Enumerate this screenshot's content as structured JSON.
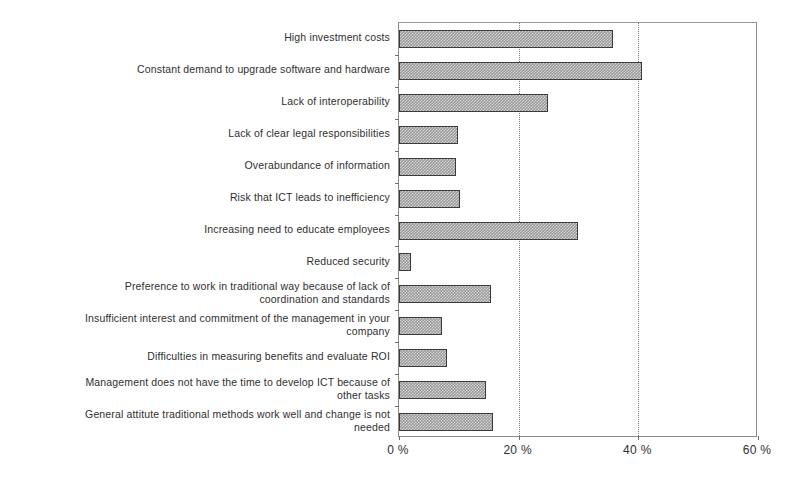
{
  "chart_data": {
    "type": "bar",
    "orientation": "horizontal",
    "title": "",
    "subtitle": "",
    "xlabel": "",
    "ylabel": "",
    "xlim": [
      0,
      60
    ],
    "xticks": [
      0,
      20,
      40,
      60
    ],
    "xticklabels": [
      "0 %",
      "20 %",
      "40 %",
      "60 %"
    ],
    "grid": "vertical-dotted-at-20-and-40",
    "legend": "none",
    "bar_color": "#9a9a9a",
    "bar_border_color": "#3b3b3b",
    "axis_color": "#8a8a8a",
    "categories": [
      "High investment costs",
      "Constant demand to upgrade software and hardware",
      "Lack of interoperability",
      "Lack of clear legal responsibilities",
      "Overabundance of information",
      "Risk that ICT leads to inefficiency",
      "Increasing need to educate employees",
      "Reduced security",
      "Preference to work in traditional way because of lack of\ncoordination and standards",
      "Insufficient interest and commitment of the management in your\ncompany",
      "Difficulties in measuring benefits and evaluate ROI",
      "Management does not have the time to develop ICT because of\nother tasks",
      "General attitute traditional methods work well and change is not\nneeded"
    ],
    "values": [
      35.8,
      40.6,
      24.9,
      9.9,
      9.5,
      10.2,
      29.9,
      2.0,
      15.4,
      7.2,
      8.0,
      14.5,
      15.7
    ]
  }
}
